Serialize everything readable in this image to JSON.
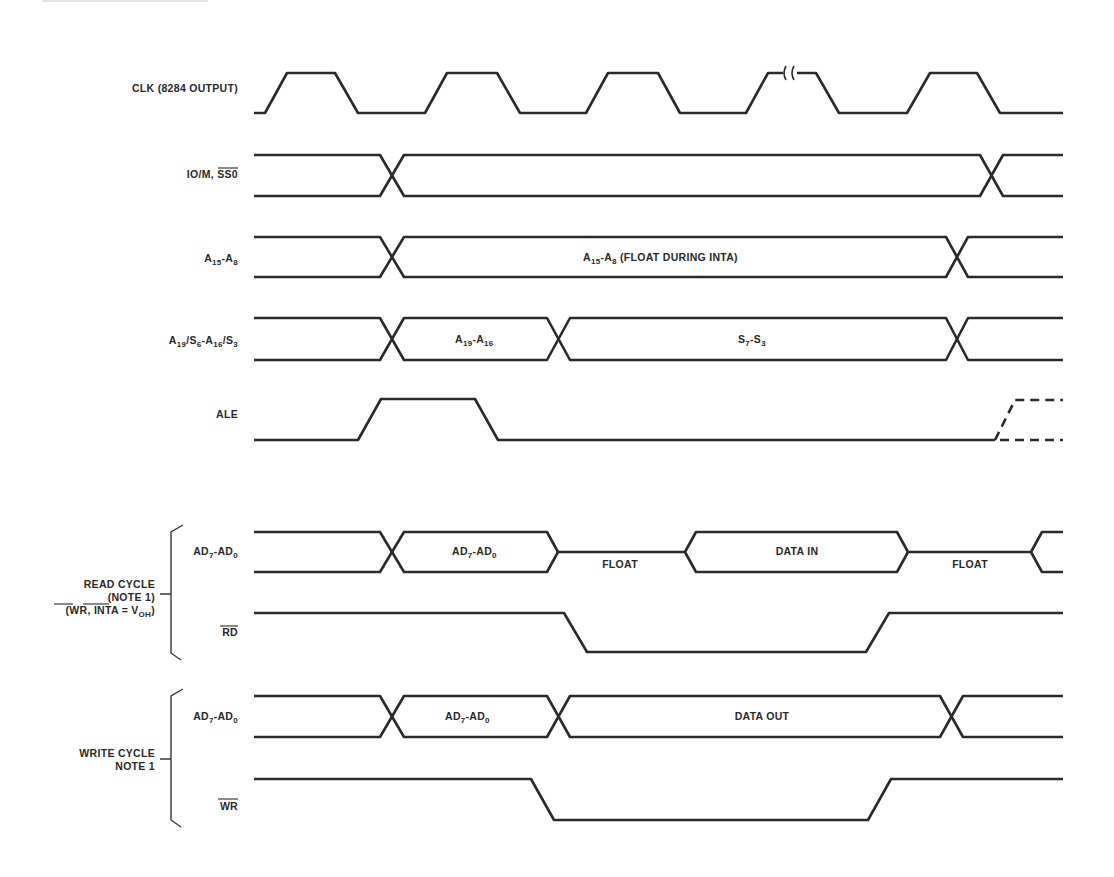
{
  "diagram": {
    "signals": [
      {
        "id": "clk",
        "label": "CLK (8284 OUTPUT)"
      },
      {
        "id": "io_m",
        "label_main": "IO/M, ",
        "label_overbar": "SS0"
      },
      {
        "id": "a15_a8",
        "label_parts": [
          "A",
          "15",
          "-A",
          "8"
        ],
        "segment_label_parts": [
          "A",
          "15",
          "-A",
          "8",
          " (FLOAT DURING INTA)"
        ]
      },
      {
        "id": "a19_s6",
        "label_parts": [
          "A",
          "19",
          "/S",
          "6",
          "-A",
          "16",
          "/S",
          "3"
        ],
        "segments": [
          {
            "label_parts": [
              "A",
              "19",
              "-A",
              "16"
            ]
          },
          {
            "label_parts": [
              "S",
              "7",
              "-S",
              "3"
            ]
          }
        ]
      },
      {
        "id": "ale",
        "label": "ALE"
      }
    ],
    "read_cycle": {
      "group_label_line1": "READ CYCLE",
      "group_label_line2": "(NOTE 1)",
      "group_label_line3_parts": [
        "(",
        "WR",
        ", ",
        "INTA",
        " = V",
        "OH",
        ")"
      ],
      "ad_label_parts": [
        "AD",
        "7",
        "-AD",
        "0"
      ],
      "ad_segments": [
        {
          "label_parts": [
            "AD",
            "7",
            "-AD",
            "0"
          ]
        },
        {
          "label": "FLOAT"
        },
        {
          "label": "DATA IN"
        },
        {
          "label": "FLOAT"
        }
      ],
      "strobe_label": "RD"
    },
    "write_cycle": {
      "group_label_line1": "WRITE CYCLE",
      "group_label_line2": "NOTE 1",
      "ad_label_parts": [
        "AD",
        "7",
        "-AD",
        "0"
      ],
      "ad_segments": [
        {
          "label_parts": [
            "AD",
            "7",
            "-AD",
            "0"
          ]
        },
        {
          "label": "DATA OUT"
        }
      ],
      "strobe_label": "WR"
    },
    "colors": {
      "line": "#2a2a2a",
      "background": "#ffffff",
      "top_rule": "#c8c8c8"
    }
  }
}
